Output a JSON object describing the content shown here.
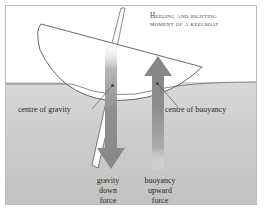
{
  "figure": {
    "kind": "physics-diagram",
    "title_lines": [
      "Heeling and righting",
      "moment of a keelboat"
    ],
    "title_full": "Heeling and righting moment of a keelboat",
    "labels": {
      "centre_of_gravity": "centre of gravity",
      "centre_of_buoyancy": "centre of buoyancy"
    },
    "forces": {
      "gravity": {
        "lines": [
          "gravity",
          "down",
          "force"
        ],
        "direction": "down",
        "color": "#8d8d8d"
      },
      "buoyancy": {
        "lines": [
          "buoyancy",
          "upward",
          "force"
        ],
        "direction": "up",
        "color": "#8d8d8d"
      }
    },
    "colors": {
      "frame_border": "#b9b9b9",
      "sky": "#ffffff",
      "water_top": "#d7d7d7",
      "water_bottom": "#c4c4c4",
      "hull_fill": "#ffffff",
      "outline": "#4d4844",
      "text": "#2a2624",
      "title_text": "#4a4542",
      "arrow": "#8e8e8e"
    },
    "annotations": {
      "waterline": "water surface across full width",
      "hull": "heeled keelboat hull, bow to left, tilted",
      "mast": "thin slanted mast rising from deck",
      "keel": "narrow fin keel angled down-left below hull"
    }
  }
}
